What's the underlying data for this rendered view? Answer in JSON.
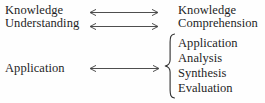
{
  "diagram": {
    "type": "mapping-diagram",
    "background_color": "#fefefe",
    "text_color": "#1f1f1f",
    "arrow_color": "#3a3a3a",
    "brace_color": "#2e2e2e"
  },
  "left_column": {
    "items": [
      {
        "label": "Knowledge"
      },
      {
        "label": "Understanding"
      },
      {
        "label": "Application"
      }
    ]
  },
  "right_column": {
    "items": [
      {
        "label": "Knowledge"
      },
      {
        "label": "Comprehension"
      },
      {
        "label": "Application"
      },
      {
        "label": "Analysis"
      },
      {
        "label": "Synthesis"
      },
      {
        "label": "Evaluation"
      }
    ],
    "grouped_items": [
      "Application",
      "Analysis",
      "Synthesis",
      "Evaluation"
    ]
  },
  "connectors": [
    {
      "name": "knowledge-link",
      "style": "double-headed-arrow",
      "from": "Knowledge",
      "to": "Knowledge"
    },
    {
      "name": "understanding-link",
      "style": "double-headed-arrow",
      "from": "Understanding",
      "to": "Comprehension"
    },
    {
      "name": "application-link",
      "style": "double-headed-arrow",
      "from": "Application",
      "to": "Application/Analysis/Synthesis/Evaluation"
    }
  ],
  "brace": {
    "name": "left-curly-brace",
    "orientation": "left",
    "groups": "Application, Analysis, Synthesis, Evaluation"
  }
}
